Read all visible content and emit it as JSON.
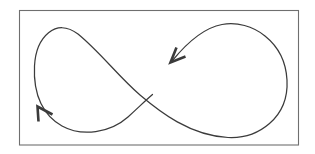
{
  "figure": {
    "background_color": "#ffffff",
    "canvas": {
      "width": 315,
      "height": 154
    }
  },
  "frame": {
    "name": "outer-border",
    "x": 19.5,
    "y": 10.5,
    "width": 279,
    "height": 134.5,
    "stroke_color": "#6f6f6f",
    "stroke_width": 1.1,
    "fill": "none"
  },
  "strokes": {
    "stroke_color": "#3b3b3b",
    "stroke_width": 1.25,
    "left_lobe": {
      "name": "left-loop",
      "center_x": 95,
      "center_y": 79,
      "radius_x": 61,
      "radius_y": 54,
      "leftmost_x": 34,
      "topmost_y": 25,
      "bottommost_y": 133
    },
    "right_lobe": {
      "name": "right-loop",
      "center_x": 222,
      "center_y": 80,
      "radius_x": 66,
      "radius_y": 58,
      "rightmost_x": 288,
      "topmost_y": 22,
      "bottommost_y": 138
    },
    "crossing": {
      "name": "center-crossover",
      "x": 160,
      "y": 80,
      "note": "strands pass near each other at the waist of the figure eight"
    },
    "main_path": "M 172.5 60.5 C 186 44 203 28 222 24.5 C 252 19 285 42 287 80 C 289 118 258 139 228 137.5 C 190 135.5 160 112 140 95 C 118 76 100 52 78 34 C 56 17 36 37 34.5 66 C 33 96 44 116 62 126 C 82 137 110 133 128 117 C 140 106 146 100 152.5 94.5",
    "second_path_note": "single continuous lemniscate stroke; both ends terminate at arrowheads"
  },
  "arrows": [
    {
      "name": "arrow-upper-right",
      "tip_x": 171,
      "tip_y": 62,
      "direction_degrees": 225,
      "direction_label": "down-left",
      "barb_length": 15,
      "barb_spread_degrees": 34,
      "stroke_width": 2.6,
      "path": "M 185.5 56.5 L 170.5 62.5 L 176.5 47.5"
    },
    {
      "name": "arrow-lower-left",
      "tip_x": 37,
      "tip_y": 106,
      "direction_degrees": 315,
      "direction_label": "up-left",
      "barb_length": 15,
      "barb_spread_degrees": 34,
      "stroke_width": 2.6,
      "path": "M 52.5 114.5 L 37.5 106.5 L 38.5 121.5"
    }
  ]
}
